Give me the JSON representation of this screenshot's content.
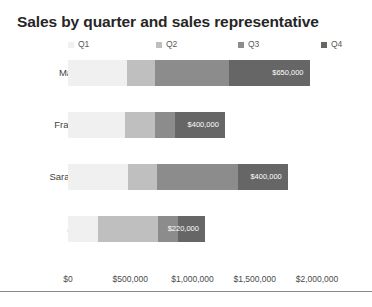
{
  "chart_data": {
    "type": "bar",
    "orientation": "horizontal",
    "stacked": true,
    "title": "Sales by quarter and sales representative",
    "xlabel": "",
    "ylabel": "",
    "xlim": [
      0,
      2000000
    ],
    "grid": false,
    "legend_position": "top",
    "categories": [
      "Marion",
      "Franklin",
      "Sarabeth",
      "John"
    ],
    "tick_labels": [
      "$0",
      "$500,000",
      "$1,000,000",
      "$1,500,000",
      "$2,000,000"
    ],
    "tick_values": [
      0,
      500000,
      1000000,
      1500000,
      2000000
    ],
    "series": [
      {
        "name": "Q1",
        "color": "#f0f0f0",
        "values": [
          470000,
          460000,
          480000,
          240000
        ]
      },
      {
        "name": "Q2",
        "color": "#bfbfbf",
        "values": [
          230000,
          240000,
          235000,
          480000
        ]
      },
      {
        "name": "Q3",
        "color": "#8c8c8c",
        "values": [
          590000,
          160000,
          650000,
          160000
        ]
      },
      {
        "name": "Q4",
        "color": "#666666",
        "values": [
          650000,
          400000,
          400000,
          220000
        ]
      }
    ],
    "point_labels": [
      {
        "category": "Marion",
        "series": "Q4",
        "text": "$650,000"
      },
      {
        "category": "Franklin",
        "series": "Q4",
        "text": "$400,000"
      },
      {
        "category": "Sarabeth",
        "series": "Q4",
        "text": "$400,000"
      },
      {
        "category": "John",
        "series": "Q4",
        "text": "$220,000"
      }
    ],
    "totals": [
      1940000,
      1260000,
      1765000,
      1100000
    ]
  },
  "legend": {
    "items": [
      {
        "label": "Q1",
        "color": "#f0f0f0"
      },
      {
        "label": "Q2",
        "color": "#bfbfbf"
      },
      {
        "label": "Q3",
        "color": "#8c8c8c"
      },
      {
        "label": "Q4",
        "color": "#666666"
      }
    ]
  },
  "colors": {
    "q1": "#f0f0f0",
    "q2": "#bfbfbf",
    "q3": "#8c8c8c",
    "q4": "#666666",
    "title": "#262626",
    "axis_line": "#8a8a8a",
    "background": "#ffffff"
  }
}
